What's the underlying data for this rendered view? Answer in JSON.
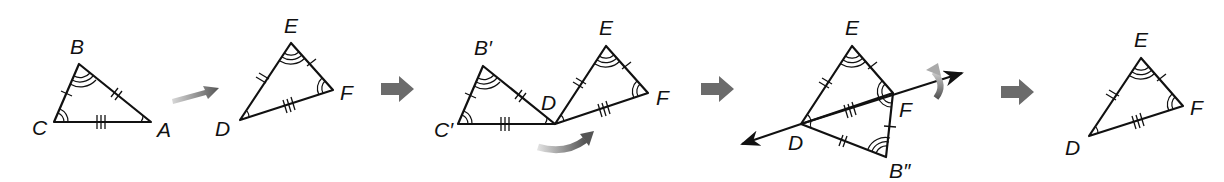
{
  "figure": {
    "steps": [
      {
        "id": "original",
        "triangles": [
          {
            "name": "ABC",
            "vertices": {
              "A": "A",
              "B": "B",
              "C": "C"
            }
          },
          {
            "name": "DEF",
            "vertices": {
              "D": "D",
              "E": "E",
              "F": "F"
            }
          }
        ],
        "transition": "translation-arrow"
      },
      {
        "id": "after-translation",
        "labels": {
          "B": "B′",
          "C": "C′",
          "D": "D",
          "E": "E",
          "F": "F"
        },
        "transition": "rotation-arrow"
      },
      {
        "id": "after-rotation",
        "labels": {
          "E": "E",
          "F": "F",
          "D": "D",
          "B": "B″"
        },
        "transition": "reflection-across-line-DF"
      },
      {
        "id": "final",
        "labels": {
          "E": "E",
          "F": "F",
          "D": "D"
        }
      }
    ],
    "markings": {
      "side_single_tick": "CB ≅ FE",
      "side_double_tick": "BA ≅ ED",
      "side_triple_tick": "CA ≅ FD",
      "angle_single_arc": "∠A ≅ ∠D",
      "angle_double_arc": "∠C ≅ ∠F",
      "angle_triple_arc": "∠B ≅ ∠E"
    },
    "colors": {
      "stroke": "#111111",
      "arrow_gray": "#6b6b6b"
    }
  }
}
